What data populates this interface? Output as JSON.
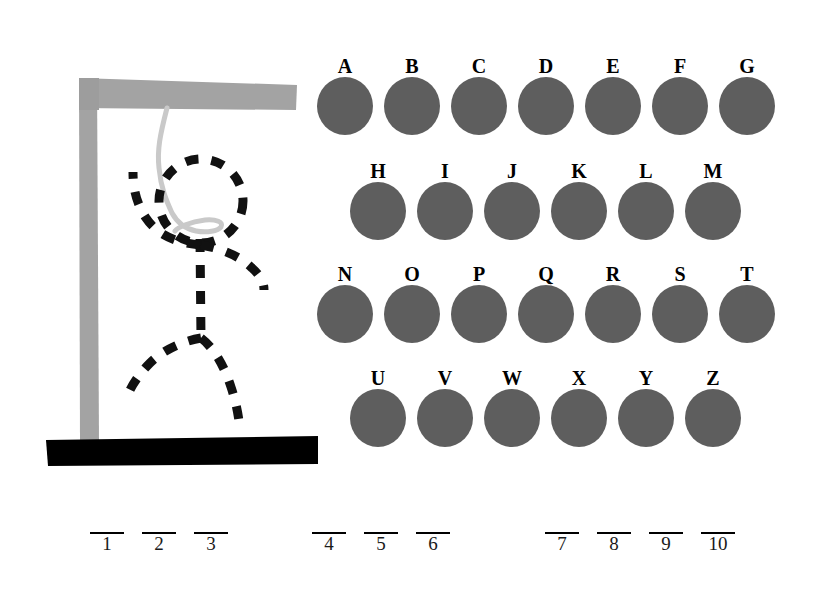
{
  "canvas": {
    "width": 831,
    "height": 604,
    "background": "#ffffff"
  },
  "colors": {
    "gallows_wood": "#a3a3a3",
    "gallows_wood_shadow": "#9a9a9a",
    "base_platform": "#000000",
    "rope": "#c9c9c9",
    "figure_stroke": "#111111",
    "letter_disc": "#5e5e5e",
    "letter_label": "#000000",
    "blank_line": "#000000",
    "blank_number": "#1a1a1a"
  },
  "gallows": {
    "post_label": "gallows-post",
    "beam_label": "gallows-beam",
    "base_label": "gallows-base",
    "rope_label": "hanging-rope"
  },
  "figure": {
    "parts_drawn": [
      "head",
      "torso",
      "left-arm",
      "right-arm",
      "left-leg",
      "right-leg"
    ],
    "stroke_style": "dashed",
    "stroke_width": 9
  },
  "letter_board": {
    "rows": [
      {
        "indent": 12,
        "top": 0,
        "keys": [
          {
            "letter": "A",
            "state": "available"
          },
          {
            "letter": "B",
            "state": "available"
          },
          {
            "letter": "C",
            "state": "available"
          },
          {
            "letter": "D",
            "state": "available"
          },
          {
            "letter": "E",
            "state": "available"
          },
          {
            "letter": "F",
            "state": "available"
          },
          {
            "letter": "G",
            "state": "available"
          }
        ]
      },
      {
        "indent": 45,
        "top": 105,
        "keys": [
          {
            "letter": "H",
            "state": "available"
          },
          {
            "letter": "I",
            "state": "available"
          },
          {
            "letter": "J",
            "state": "available"
          },
          {
            "letter": "K",
            "state": "available"
          },
          {
            "letter": "L",
            "state": "available"
          },
          {
            "letter": "M",
            "state": "available"
          }
        ]
      },
      {
        "indent": 12,
        "top": 208,
        "keys": [
          {
            "letter": "N",
            "state": "available"
          },
          {
            "letter": "O",
            "state": "available"
          },
          {
            "letter": "P",
            "state": "available"
          },
          {
            "letter": "Q",
            "state": "available"
          },
          {
            "letter": "R",
            "state": "available"
          },
          {
            "letter": "S",
            "state": "available"
          },
          {
            "letter": "T",
            "state": "available"
          }
        ]
      },
      {
        "indent": 45,
        "top": 312,
        "keys": [
          {
            "letter": "U",
            "state": "available"
          },
          {
            "letter": "V",
            "state": "available"
          },
          {
            "letter": "W",
            "state": "available"
          },
          {
            "letter": "X",
            "state": "available"
          },
          {
            "letter": "Y",
            "state": "available"
          },
          {
            "letter": "Z",
            "state": "available"
          }
        ]
      }
    ]
  },
  "answer": {
    "total_blanks": 10,
    "words": [
      {
        "left": 90,
        "blanks": [
          {
            "index": "1",
            "letter": ""
          },
          {
            "index": "2",
            "letter": ""
          },
          {
            "index": "3",
            "letter": ""
          }
        ]
      },
      {
        "left": 312,
        "blanks": [
          {
            "index": "4",
            "letter": ""
          },
          {
            "index": "5",
            "letter": ""
          },
          {
            "index": "6",
            "letter": ""
          }
        ]
      },
      {
        "left": 545,
        "blanks": [
          {
            "index": "7",
            "letter": ""
          },
          {
            "index": "8",
            "letter": ""
          },
          {
            "index": "9",
            "letter": ""
          },
          {
            "index": "10",
            "letter": ""
          }
        ]
      }
    ]
  }
}
